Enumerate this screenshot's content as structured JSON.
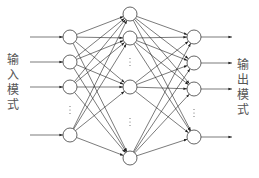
{
  "diagram": {
    "type": "feedforward-neural-network",
    "input_label": [
      "输",
      "入",
      "模",
      "式"
    ],
    "output_label": [
      "输",
      "出",
      "模",
      "式"
    ],
    "ellipsis": "⋮",
    "colors": {
      "stroke": "#222222",
      "text": "#555555",
      "background": "#ffffff"
    },
    "layers": [
      {
        "name": "input",
        "x": 70,
        "nodes_y": [
          37,
          62,
          87,
          135
        ],
        "ellipsis_y": 110
      },
      {
        "name": "hidden",
        "x": 130,
        "nodes_y": [
          14,
          38,
          87,
          158
        ],
        "ellipsis_y": [
          62,
          122
        ]
      },
      {
        "name": "output",
        "x": 194,
        "nodes_y": [
          37,
          63,
          89,
          137
        ],
        "ellipsis_y": 113
      }
    ],
    "node_radius": 7
  }
}
